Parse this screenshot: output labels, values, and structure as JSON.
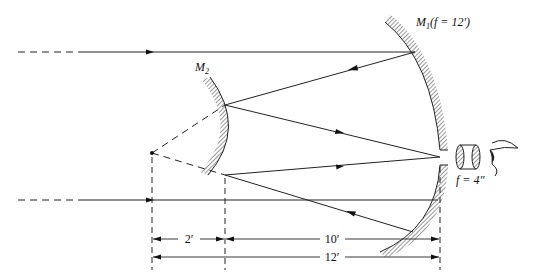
{
  "diagram": {
    "type": "Cassegrain telescope ray diagram",
    "labels": {
      "primary_mirror": "M",
      "primary_mirror_sub": "1",
      "primary_mirror_focal": "(f = 12′)",
      "secondary_mirror": "M",
      "secondary_mirror_sub": "2",
      "eyepiece_focal": "f = 4″"
    },
    "dimensions": {
      "mirror_separation_small": "2′",
      "mirror_separation_large": "10′",
      "total": "12′"
    },
    "elements": [
      "incoming-ray-top",
      "incoming-ray-bottom",
      "primary-mirror-M1",
      "secondary-mirror-M2",
      "virtual-focus-point",
      "eyepiece-lens",
      "observer-eye"
    ],
    "colors": {
      "ink": "#222222",
      "background": "#ffffff"
    }
  }
}
